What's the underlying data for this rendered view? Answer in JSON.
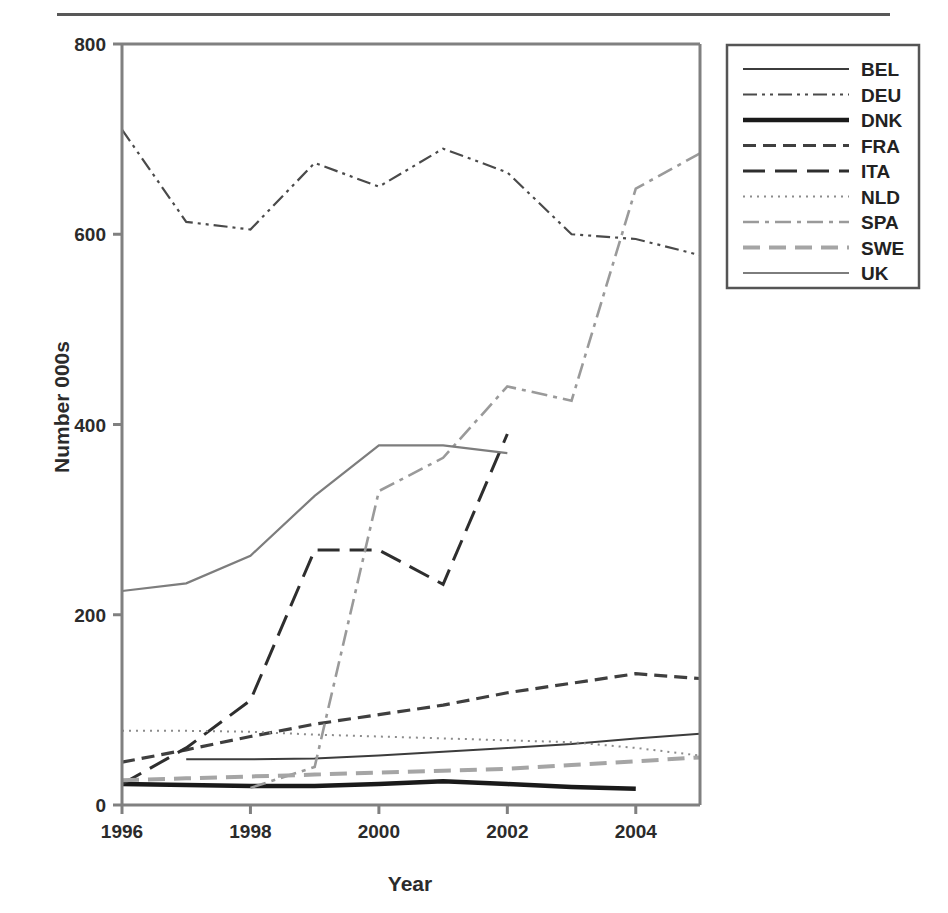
{
  "figure": {
    "has_top_rule": true,
    "background": "#ffffff"
  },
  "chart_data": {
    "type": "line",
    "title": "",
    "xlabel": "Year",
    "ylabel": "Number 000s",
    "xlim": [
      1996,
      2005
    ],
    "ylim": [
      0,
      800
    ],
    "xticks": [
      1996,
      1998,
      2000,
      2002,
      2004
    ],
    "xticklabels": [
      "1996",
      "1998",
      "2000",
      "2002",
      "2004"
    ],
    "yticks": [
      0,
      200,
      400,
      600,
      800
    ],
    "yticklabels": [
      "0",
      "200",
      "400",
      "600",
      "800"
    ],
    "grid": false,
    "legend_position": "right-outside",
    "legend_entries": [
      "BEL",
      "DEU",
      "DNK",
      "FRA",
      "ITA",
      "NLD",
      "SPA",
      "SWE",
      "UK"
    ],
    "series": [
      {
        "name": "BEL",
        "style": "solid",
        "color": "#3c3c3c",
        "width": 2.0,
        "dash": "none",
        "x": [
          1997,
          1998,
          1999,
          2000,
          2001,
          2002,
          2003,
          2004,
          2005
        ],
        "values": [
          48,
          48,
          49,
          52,
          56,
          60,
          64,
          70,
          75
        ]
      },
      {
        "name": "DEU",
        "style": "dash-dot-dot",
        "color": "#4a4a4a",
        "width": 2.2,
        "dash": "14,5,3,5,3,5",
        "x": [
          1996,
          1997,
          1998,
          1999,
          2000,
          2001,
          2002,
          2003,
          2004,
          2005
        ],
        "values": [
          710,
          613,
          605,
          675,
          650,
          690,
          665,
          600,
          595,
          578
        ]
      },
      {
        "name": "DNK",
        "style": "solid-thick",
        "color": "#1a1a1a",
        "width": 4.5,
        "dash": "none",
        "x": [
          1996,
          1997,
          1998,
          1999,
          2000,
          2001,
          2002,
          2003,
          2004
        ],
        "values": [
          22,
          21,
          20,
          20,
          22,
          25,
          22,
          19,
          17
        ]
      },
      {
        "name": "FRA",
        "style": "dashed",
        "color": "#3f3f3f",
        "width": 3.2,
        "dash": "13,7",
        "x": [
          1996,
          1997,
          1998,
          1999,
          2000,
          2001,
          2002,
          2003,
          2004,
          2005
        ],
        "values": [
          45,
          58,
          72,
          85,
          95,
          105,
          118,
          128,
          138,
          133
        ]
      },
      {
        "name": "ITA",
        "style": "long-dash",
        "color": "#2e2e2e",
        "width": 3.0,
        "dash": "22,10",
        "x": [
          1996,
          1997,
          1998,
          1999,
          2000,
          2001,
          2002
        ],
        "values": [
          22,
          60,
          110,
          268,
          268,
          232,
          390
        ]
      },
      {
        "name": "NLD",
        "style": "dotted",
        "color": "#8c8c8c",
        "width": 2.0,
        "dash": "2,5",
        "x": [
          1996,
          1997,
          1998,
          1999,
          2000,
          2001,
          2002,
          2003,
          2004,
          2005
        ],
        "values": [
          78,
          78,
          77,
          74,
          72,
          70,
          68,
          66,
          60,
          52
        ]
      },
      {
        "name": "SPA",
        "style": "dash-dot",
        "color": "#9a9a9a",
        "width": 2.6,
        "dash": "16,6,4,6",
        "x": [
          1998,
          1999,
          2000,
          2001,
          2002,
          2003,
          2004,
          2005
        ],
        "values": [
          18,
          40,
          330,
          365,
          440,
          425,
          648,
          685
        ]
      },
      {
        "name": "SWE",
        "style": "dashed-grey",
        "color": "#a5a5a5",
        "width": 4.0,
        "dash": "17,9",
        "x": [
          1996,
          1997,
          1998,
          1999,
          2000,
          2001,
          2002,
          2003,
          2004,
          2005
        ],
        "values": [
          26,
          28,
          30,
          32,
          34,
          36,
          38,
          42,
          46,
          50
        ]
      },
      {
        "name": "UK",
        "style": "solid-thin-grey",
        "color": "#7d7d7d",
        "width": 2.2,
        "dash": "none",
        "x": [
          1996,
          1997,
          1998,
          1999,
          2000,
          2001,
          2002
        ],
        "values": [
          225,
          233,
          262,
          325,
          378,
          378,
          370
        ]
      }
    ]
  }
}
